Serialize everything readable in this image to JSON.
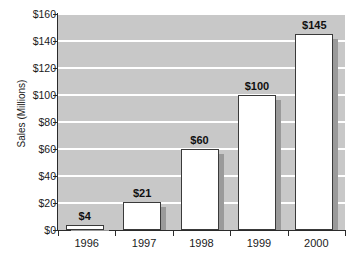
{
  "chart_data": {
    "type": "bar",
    "title": "",
    "xlabel": "",
    "ylabel": "Sales (Millions)",
    "categories": [
      "1996",
      "1997",
      "1998",
      "1999",
      "2000"
    ],
    "values": [
      4,
      21,
      60,
      100,
      145
    ],
    "value_labels": [
      "$4",
      "$21",
      "$60",
      "$100",
      "$145"
    ],
    "ylim": [
      0,
      160
    ],
    "ytick_values": [
      0,
      20,
      40,
      60,
      80,
      100,
      120,
      140,
      160
    ],
    "ytick_labels": [
      "$0",
      "$20",
      "$40",
      "$60",
      "$80",
      "$100",
      "$120",
      "$140",
      "$160"
    ],
    "grid": true,
    "legend": false,
    "legend_position": "none",
    "colors": {
      "plot_background": "#c8c8c8",
      "gridline": "#ffffff",
      "bar_fill": "#ffffff",
      "bar_outline": "#3a3a3a",
      "bar_shadow": "#9a9a9a",
      "axis": "#2b2b2b",
      "text": "#1a1a1a",
      "page_background": "#ffffff"
    }
  }
}
